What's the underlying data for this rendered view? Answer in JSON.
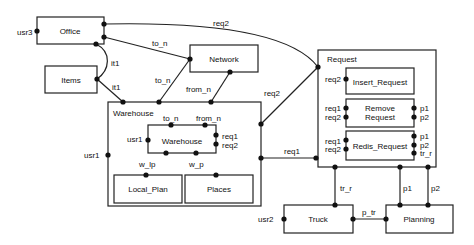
{
  "diagram": {
    "components": {
      "office": "Office",
      "items": "Items",
      "network": "Network",
      "warehouse_outer": "Warehouse",
      "warehouse_inner": "Warehouse",
      "local_plan": "Local_Plan",
      "places": "Places",
      "request": "Request",
      "insert_request": "Insert_Request",
      "remove_request_1": "Remove",
      "remove_request_2": "Request",
      "redis_request": "Redis_Request",
      "truck": "Truck",
      "planning": "Planning"
    },
    "ports": {
      "usr3": "usr3",
      "usr1_outer": "usr1",
      "usr1_inner": "usr1",
      "usr2": "usr2",
      "it1_a": "it1",
      "it1_b": "it1",
      "to_n_a": "to_n",
      "to_n_b": "to_n",
      "to_n_inner": "to_n",
      "from_n": "from_n",
      "from_n_inner": "from_n",
      "req1_inner": "req1",
      "req2_inner": "req2",
      "req2_top": "req2",
      "req2_mid": "req2",
      "req1_mid": "req1",
      "w_lp": "w_lp",
      "w_p": "w_p",
      "ins_req2": "req2",
      "rem_req1": "req1",
      "rem_req2": "req2",
      "rem_p1": "p1",
      "rem_p2": "p2",
      "red_req1": "req1",
      "red_req2": "req2",
      "red_p1": "p1",
      "red_p2": "p2",
      "red_tr_r": "tr_r",
      "tr_r": "tr_r",
      "p1": "p1",
      "p2": "p2",
      "p_tr": "p_tr"
    }
  }
}
